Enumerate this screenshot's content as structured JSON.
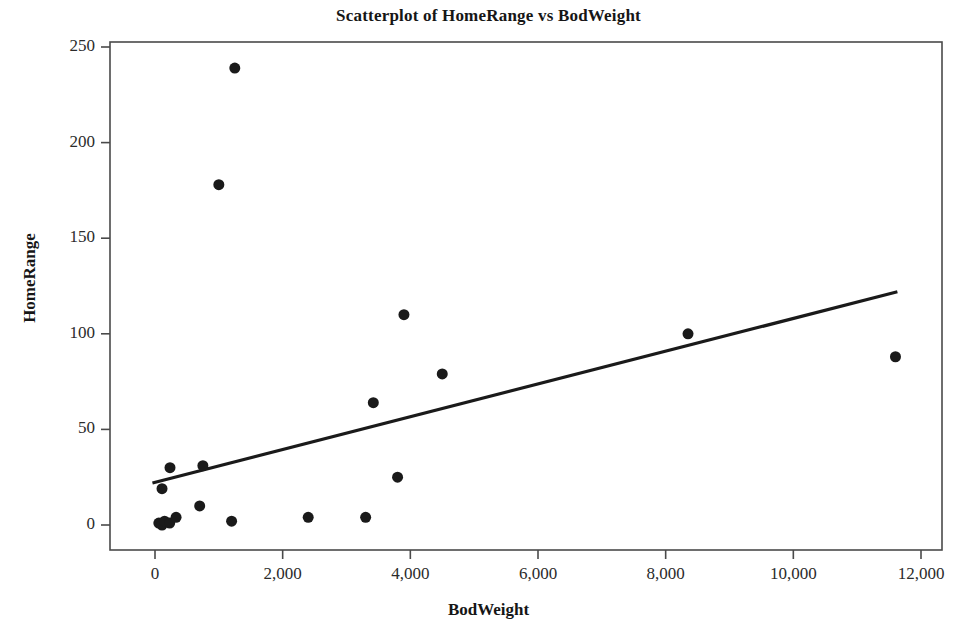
{
  "chart_data": {
    "type": "scatter",
    "title": "Scatterplot of HomeRange vs BodWeight",
    "xlabel": "BodWeight",
    "ylabel": "HomeRange",
    "xlim": [
      -400,
      12600
    ],
    "ylim": [
      -12,
      258
    ],
    "xticks": [
      0,
      2000,
      4000,
      6000,
      8000,
      10000,
      12000
    ],
    "xticklabels": [
      "0",
      "2,000",
      "4,000",
      "6,000",
      "8,000",
      "10,000",
      "12,000"
    ],
    "yticks": [
      0,
      50,
      100,
      150,
      200,
      250
    ],
    "yticklabels": [
      "0",
      "50",
      "100",
      "150",
      "200",
      "250"
    ],
    "grid": false,
    "legend": "none",
    "marker": {
      "shape": "circle",
      "color": "#1a1a1a",
      "size": 11
    },
    "points": [
      {
        "x": 60,
        "y": 1
      },
      {
        "x": 110,
        "y": 0
      },
      {
        "x": 150,
        "y": 2
      },
      {
        "x": 230,
        "y": 1
      },
      {
        "x": 110,
        "y": 19
      },
      {
        "x": 235,
        "y": 30
      },
      {
        "x": 330,
        "y": 4
      },
      {
        "x": 700,
        "y": 10
      },
      {
        "x": 750,
        "y": 31
      },
      {
        "x": 1000,
        "y": 178
      },
      {
        "x": 1200,
        "y": 2
      },
      {
        "x": 1250,
        "y": 239
      },
      {
        "x": 2400,
        "y": 4
      },
      {
        "x": 3300,
        "y": 4
      },
      {
        "x": 3420,
        "y": 64
      },
      {
        "x": 3800,
        "y": 25
      },
      {
        "x": 3900,
        "y": 110
      },
      {
        "x": 4500,
        "y": 79
      },
      {
        "x": 8350,
        "y": 100
      },
      {
        "x": 11600,
        "y": 88
      }
    ],
    "fit_line": {
      "name": "regression-line",
      "color": "#1a1a1a",
      "width": 3.2,
      "x_start": -40,
      "y_start": 22,
      "x_end": 11630,
      "y_end": 122
    }
  },
  "axes": {
    "frame_color": "#4a4a4a",
    "frame_width": 1.6
  }
}
